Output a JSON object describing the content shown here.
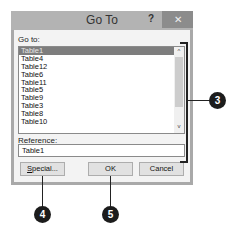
{
  "dialog": {
    "title": "Go To",
    "help_label": "?",
    "close_label": "✕",
    "goto_label": "Go to:",
    "list_items": [
      "Table1",
      "Table4",
      "Table12",
      "Table6",
      "Table11",
      "Table5",
      "Table9",
      "Table3",
      "Table8",
      "Table10"
    ],
    "selected_index": 0,
    "scroll_up": "^",
    "scroll_down": "v",
    "reference_label_first": "R",
    "reference_label_rest": "eference:",
    "reference_value": "Table1",
    "buttons": {
      "special_first": "S",
      "special_rest": "pecial...",
      "ok": "OK",
      "cancel": "Cancel"
    }
  },
  "callouts": [
    "3",
    "4",
    "5"
  ]
}
